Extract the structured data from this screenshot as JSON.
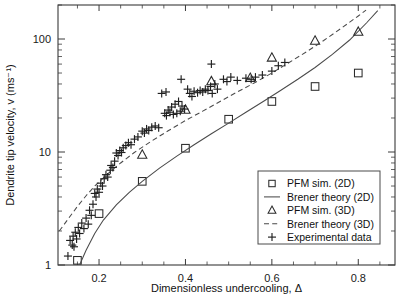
{
  "chart_data": {
    "type": "scatter",
    "title": "",
    "xlabel": "Dimensionless undercooling, Δ",
    "ylabel": "Dendrite tip velocity, v (ms⁻¹)",
    "xscale": "linear",
    "yscale": "log",
    "xlim": [
      0.105,
      0.885
    ],
    "ylim": [
      1,
      200
    ],
    "grid": false,
    "xticks": [
      0.2,
      0.4,
      0.6,
      0.8
    ],
    "xticklabels": [
      "0.2",
      "0.4",
      "0.6",
      "0.8"
    ],
    "yticks": [
      1,
      10,
      100
    ],
    "yticklabels": [
      "1",
      "10",
      "100"
    ],
    "legend_position": "lower right",
    "series": [
      {
        "name": "PFM sim. (2D)",
        "marker": "square",
        "style": "markers",
        "points": [
          [
            0.15,
            1.1
          ],
          [
            0.2,
            2.85
          ],
          [
            0.3,
            5.5
          ],
          [
            0.4,
            10.8
          ],
          [
            0.5,
            19.5
          ],
          [
            0.6,
            28.0
          ],
          [
            0.7,
            38.0
          ],
          [
            0.8,
            50.0
          ]
        ]
      },
      {
        "name": "Brener theory (2D)",
        "marker": "line",
        "style": "solid",
        "points": [
          [
            0.155,
            1.0
          ],
          [
            0.17,
            1.35
          ],
          [
            0.19,
            1.9
          ],
          [
            0.21,
            2.5
          ],
          [
            0.24,
            3.4
          ],
          [
            0.27,
            4.4
          ],
          [
            0.3,
            5.5
          ],
          [
            0.34,
            7.2
          ],
          [
            0.38,
            9.2
          ],
          [
            0.42,
            11.6
          ],
          [
            0.46,
            14.5
          ],
          [
            0.5,
            18.0
          ],
          [
            0.54,
            22.5
          ],
          [
            0.58,
            28.0
          ],
          [
            0.62,
            35.0
          ],
          [
            0.66,
            44.0
          ],
          [
            0.7,
            56.0
          ],
          [
            0.74,
            73.0
          ],
          [
            0.78,
            98.0
          ],
          [
            0.82,
            140.0
          ],
          [
            0.845,
            178.0
          ]
        ]
      },
      {
        "name": "PFM sim. (3D)",
        "marker": "triangle",
        "style": "markers",
        "points": [
          [
            0.3,
            9.4
          ],
          [
            0.4,
            23.5
          ],
          [
            0.46,
            42.0
          ],
          [
            0.55,
            45.0
          ],
          [
            0.6,
            68.0
          ],
          [
            0.7,
            96.0
          ],
          [
            0.8,
            115.0
          ]
        ]
      },
      {
        "name": "Brener theory (3D)",
        "marker": "line",
        "style": "dashed",
        "points": [
          [
            0.108,
            2.0
          ],
          [
            0.13,
            2.6
          ],
          [
            0.15,
            3.3
          ],
          [
            0.17,
            4.1
          ],
          [
            0.19,
            5.0
          ],
          [
            0.22,
            6.4
          ],
          [
            0.25,
            8.0
          ],
          [
            0.28,
            9.8
          ],
          [
            0.32,
            12.4
          ],
          [
            0.36,
            15.4
          ],
          [
            0.4,
            19.0
          ],
          [
            0.44,
            23.0
          ],
          [
            0.48,
            28.0
          ],
          [
            0.52,
            34.0
          ],
          [
            0.56,
            41.0
          ],
          [
            0.6,
            50.0
          ],
          [
            0.64,
            62.0
          ],
          [
            0.68,
            77.0
          ],
          [
            0.72,
            97.0
          ],
          [
            0.76,
            124.0
          ],
          [
            0.8,
            160.0
          ],
          [
            0.818,
            180.0
          ]
        ]
      },
      {
        "name": "Experimental data",
        "marker": "plus",
        "style": "markers",
        "points": [
          [
            0.128,
            1.2
          ],
          [
            0.133,
            1.65
          ],
          [
            0.138,
            1.5
          ],
          [
            0.14,
            1.8
          ],
          [
            0.142,
            1.45
          ],
          [
            0.145,
            1.95
          ],
          [
            0.148,
            1.7
          ],
          [
            0.152,
            2.15
          ],
          [
            0.155,
            1.9
          ],
          [
            0.16,
            2.35
          ],
          [
            0.165,
            2.1
          ],
          [
            0.17,
            2.6
          ],
          [
            0.175,
            2.3
          ],
          [
            0.178,
            3.05
          ],
          [
            0.182,
            2.75
          ],
          [
            0.186,
            3.45
          ],
          [
            0.19,
            4.3
          ],
          [
            0.193,
            4.0
          ],
          [
            0.196,
            4.7
          ],
          [
            0.2,
            4.4
          ],
          [
            0.204,
            5.3
          ],
          [
            0.208,
            5.0
          ],
          [
            0.212,
            5.8
          ],
          [
            0.216,
            6.3
          ],
          [
            0.22,
            6.0
          ],
          [
            0.226,
            6.9
          ],
          [
            0.232,
            7.3
          ],
          [
            0.24,
            9.8
          ],
          [
            0.244,
            9.3
          ],
          [
            0.248,
            10.3
          ],
          [
            0.252,
            9.9
          ],
          [
            0.256,
            10.9
          ],
          [
            0.262,
            11.4
          ],
          [
            0.268,
            12.1
          ],
          [
            0.274,
            11.6
          ],
          [
            0.282,
            13.0
          ],
          [
            0.29,
            13.6
          ],
          [
            0.3,
            15.3
          ],
          [
            0.305,
            14.7
          ],
          [
            0.31,
            16.0
          ],
          [
            0.315,
            15.5
          ],
          [
            0.322,
            16.6
          ],
          [
            0.33,
            17.0
          ],
          [
            0.338,
            16.4
          ],
          [
            0.352,
            22.0
          ],
          [
            0.356,
            21.0
          ],
          [
            0.36,
            23.5
          ],
          [
            0.364,
            22.5
          ],
          [
            0.368,
            25.0
          ],
          [
            0.372,
            21.5
          ],
          [
            0.376,
            26.5
          ],
          [
            0.38,
            22.0
          ],
          [
            0.384,
            28.0
          ],
          [
            0.388,
            23.0
          ],
          [
            0.392,
            25.5
          ],
          [
            0.398,
            24.0
          ],
          [
            0.41,
            33.0
          ],
          [
            0.415,
            31.0
          ],
          [
            0.42,
            34.5
          ],
          [
            0.428,
            33.5
          ],
          [
            0.434,
            35.0
          ],
          [
            0.44,
            34.0
          ],
          [
            0.446,
            36.0
          ],
          [
            0.452,
            35.0
          ],
          [
            0.458,
            38.0
          ],
          [
            0.462,
            33.0
          ],
          [
            0.468,
            40.0
          ],
          [
            0.474,
            36.0
          ],
          [
            0.46,
            60.0
          ],
          [
            0.488,
            44.0
          ],
          [
            0.496,
            42.0
          ],
          [
            0.505,
            46.0
          ],
          [
            0.52,
            43.0
          ],
          [
            0.54,
            45.0
          ],
          [
            0.552,
            44.0
          ],
          [
            0.562,
            46.0
          ],
          [
            0.578,
            48.0
          ],
          [
            0.6,
            52.0
          ],
          [
            0.615,
            58.0
          ],
          [
            0.63,
            62.0
          ],
          [
            0.39,
            44.0
          ],
          [
            0.405,
            36.0
          ],
          [
            0.355,
            34.0
          ],
          [
            0.345,
            33.0
          ],
          [
            0.236,
            8.3
          ],
          [
            0.228,
            7.6
          ]
        ]
      }
    ]
  },
  "legend": {
    "entries": [
      {
        "label": "PFM sim. (2D)",
        "symbol": "square"
      },
      {
        "label": "Brener theory (2D)",
        "symbol": "solid-line"
      },
      {
        "label": "PFM sim. (3D)",
        "symbol": "triangle"
      },
      {
        "label": "Brener theory (3D)",
        "symbol": "dashed-line"
      },
      {
        "label": "Experimental data",
        "symbol": "plus"
      }
    ]
  },
  "colors": {
    "axis": "#3a3a3a",
    "curve": "#4a4a4a",
    "marker": "#2b2b2b",
    "text": "#111111",
    "background": "#ffffff"
  }
}
